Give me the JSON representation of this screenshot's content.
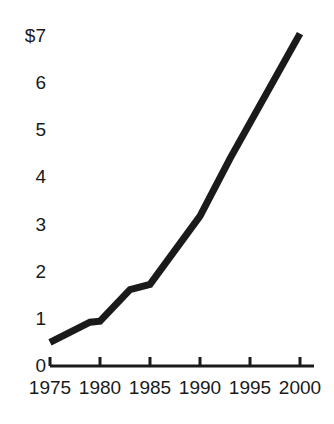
{
  "chart_data": {
    "type": "line",
    "title": "",
    "subtitle": "",
    "xlabel": "",
    "ylabel": "",
    "x": [
      1975,
      1979,
      1980,
      1983,
      1985,
      1990,
      1993,
      2000
    ],
    "values": [
      0.5,
      0.93,
      0.95,
      1.62,
      1.73,
      3.18,
      4.4,
      7.05
    ],
    "series": [
      {
        "name": "value",
        "values": [
          0.5,
          0.93,
          0.95,
          1.62,
          1.73,
          3.18,
          4.4,
          7.05
        ]
      }
    ],
    "xlim": [
      1975,
      2000
    ],
    "ylim": [
      0,
      7
    ],
    "x_tick_labels": [
      "1975",
      "1980",
      "1985",
      "1990",
      "1995",
      "2000"
    ],
    "x_tick_values": [
      1975,
      1980,
      1985,
      1990,
      1995,
      2000
    ],
    "y_tick_labels": [
      "$7",
      "6",
      "5",
      "4",
      "3",
      "2",
      "1",
      "0"
    ],
    "y_tick_values": [
      7,
      6,
      5,
      4,
      3,
      2,
      1,
      0
    ],
    "grid": false,
    "legend": false,
    "legend_position": "none",
    "line_color": "#1a1a1a",
    "line_width": 7,
    "axis_color": "#1a1a1a",
    "background_color": "#ffffff",
    "annotations": []
  },
  "axes": {
    "y_axis_visible": false,
    "x_axis_visible": true,
    "tick_direction": "up"
  }
}
